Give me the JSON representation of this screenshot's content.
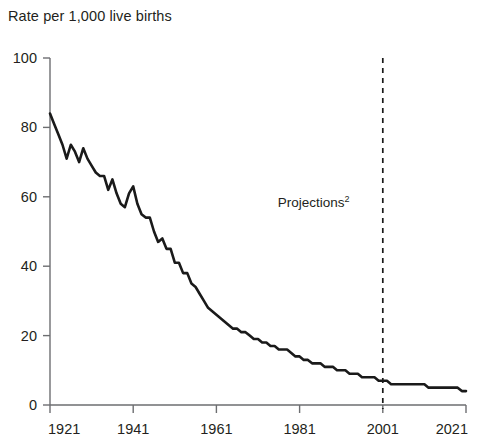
{
  "chart_data": {
    "type": "line",
    "title": "Rate per 1,000 live births",
    "subtitle": "",
    "xlabel": "",
    "ylabel": "Rate per 1,000 live births",
    "xlim": [
      1921,
      2021
    ],
    "ylim": [
      0,
      100
    ],
    "grid": false,
    "legend_position": "none",
    "x_ticks": [
      1921,
      1941,
      1961,
      1981,
      2001,
      2021
    ],
    "x_tick_labels": [
      "1921",
      "1941",
      "1961",
      "1981",
      "2001",
      "2021"
    ],
    "y_ticks": [
      0,
      20,
      40,
      60,
      80,
      100
    ],
    "y_tick_labels": [
      "0",
      "20",
      "40",
      "60",
      "80",
      "100"
    ],
    "line_color": "#1a1a1a",
    "line_width": 2.6,
    "annotations": [
      {
        "name": "projections-label",
        "text": "Projections",
        "superscript": "2",
        "x": 1993,
        "y": 57,
        "align": "end"
      }
    ],
    "reference_lines": [
      {
        "name": "projections-divider",
        "orientation": "vertical",
        "x": 2001,
        "style": "dashed",
        "color": "#1a1a1a"
      }
    ],
    "series": [
      {
        "name": "Infant mortality rate",
        "x": [
          1921,
          1922,
          1923,
          1924,
          1925,
          1926,
          1927,
          1928,
          1929,
          1930,
          1931,
          1932,
          1933,
          1934,
          1935,
          1936,
          1937,
          1938,
          1939,
          1940,
          1941,
          1942,
          1943,
          1944,
          1945,
          1946,
          1947,
          1948,
          1949,
          1950,
          1951,
          1952,
          1953,
          1954,
          1955,
          1956,
          1957,
          1958,
          1959,
          1960,
          1961,
          1962,
          1963,
          1964,
          1965,
          1966,
          1967,
          1968,
          1969,
          1970,
          1971,
          1972,
          1973,
          1974,
          1975,
          1976,
          1977,
          1978,
          1979,
          1980,
          1981,
          1982,
          1983,
          1984,
          1985,
          1986,
          1987,
          1988,
          1989,
          1990,
          1991,
          1992,
          1993,
          1994,
          1995,
          1996,
          1997,
          1998,
          1999,
          2000,
          2001,
          2002,
          2003,
          2004,
          2005,
          2006,
          2007,
          2008,
          2009,
          2010,
          2011,
          2012,
          2013,
          2014,
          2015,
          2016,
          2017,
          2018,
          2019,
          2020,
          2021
        ],
        "values": [
          84,
          81,
          78,
          75,
          71,
          75,
          73,
          70,
          74,
          71,
          69,
          67,
          66,
          66,
          62,
          65,
          61,
          58,
          57,
          61,
          63,
          58,
          55,
          54,
          54,
          50,
          47,
          48,
          45,
          45,
          41,
          41,
          38,
          38,
          35,
          34,
          32,
          30,
          28,
          27,
          26,
          25,
          24,
          23,
          22,
          22,
          21,
          21,
          20,
          19,
          19,
          18,
          18,
          17,
          17,
          16,
          16,
          16,
          15,
          14,
          14,
          13,
          13,
          12,
          12,
          12,
          11,
          11,
          11,
          10,
          10,
          10,
          9,
          9,
          9,
          8,
          8,
          8,
          8,
          7,
          7,
          7,
          6,
          6,
          6,
          6,
          6,
          6,
          6,
          6,
          6,
          5,
          5,
          5,
          5,
          5,
          5,
          5,
          5,
          4,
          4
        ]
      }
    ]
  },
  "figure": {
    "title_text": "Rate per 1,000 live births"
  }
}
